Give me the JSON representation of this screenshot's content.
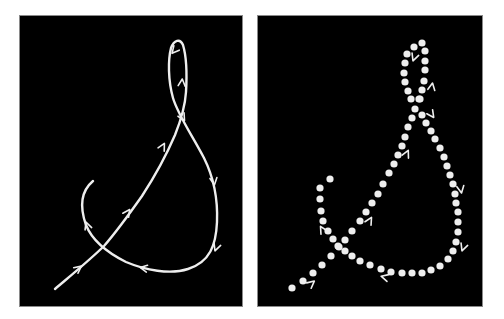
{
  "figure": {
    "colors": {
      "background": "#ffffff",
      "panel": "#000000",
      "stroke": "#eeeeee",
      "panel_border": "#8a8a8a"
    },
    "panels": [
      {
        "id": "left",
        "style": "continuous-curve",
        "path": "M55,289 C75,272 92,258 104,246 C118,230 130,213 142,196 C155,176 166,156 175,135 C181,120 185,108 186,92 C187,75 186,55 183,45 C180,38 174,40 171,48 C168,60 168,80 173,98 C178,115 192,135 204,158 C213,176 218,198 217,222 C216,245 210,262 188,269 C170,275 145,270 126,262 C108,253 92,240 86,225 C80,208 80,192 93,181",
        "arrows": [
          {
            "x": 79,
            "y": 268,
            "angle": -38
          },
          {
            "x": 128,
            "y": 212,
            "angle": -55
          },
          {
            "x": 163,
            "y": 146,
            "angle": -62
          },
          {
            "x": 182,
            "y": 82,
            "angle": -85
          },
          {
            "x": 174,
            "y": 51,
            "angle": 130
          },
          {
            "x": 183,
            "y": 118,
            "angle": 60
          },
          {
            "x": 214,
            "y": 182,
            "angle": 82
          },
          {
            "x": 216,
            "y": 248,
            "angle": 110
          },
          {
            "x": 143,
            "y": 268,
            "angle": 190
          },
          {
            "x": 87,
            "y": 225,
            "angle": -110
          }
        ]
      },
      {
        "id": "right",
        "style": "dotted-sequence",
        "dot_radius": 3.6,
        "dots": [
          [
            292,
            288
          ],
          [
            303,
            281
          ],
          [
            313,
            273
          ],
          [
            322,
            265
          ],
          [
            331,
            256
          ],
          [
            339,
            247
          ],
          [
            345,
            240
          ],
          [
            352,
            231
          ],
          [
            360,
            221
          ],
          [
            366,
            212
          ],
          [
            372,
            203
          ],
          [
            378,
            194
          ],
          [
            383,
            184
          ],
          [
            389,
            173
          ],
          [
            394,
            164
          ],
          [
            398,
            155
          ],
          [
            402,
            146
          ],
          [
            405,
            137
          ],
          [
            408,
            127
          ],
          [
            412,
            118
          ],
          [
            415,
            109
          ],
          [
            419,
            99
          ],
          [
            422,
            90
          ],
          [
            424,
            81
          ],
          [
            425,
            70
          ],
          [
            425,
            61
          ],
          [
            425,
            51
          ],
          [
            422,
            43
          ],
          [
            414,
            47
          ],
          [
            407,
            54
          ],
          [
            405,
            63
          ],
          [
            404,
            73
          ],
          [
            405,
            82
          ],
          [
            408,
            91
          ],
          [
            411,
            99
          ],
          [
            420,
            99
          ],
          [
            422,
            115
          ],
          [
            426,
            123
          ],
          [
            431,
            131
          ],
          [
            435,
            139
          ],
          [
            440,
            148
          ],
          [
            444,
            157
          ],
          [
            447,
            166
          ],
          [
            450,
            175
          ],
          [
            453,
            184
          ],
          [
            455,
            194
          ],
          [
            456,
            203
          ],
          [
            458,
            212
          ],
          [
            458,
            222
          ],
          [
            458,
            232
          ],
          [
            456,
            242
          ],
          [
            453,
            251
          ],
          [
            448,
            259
          ],
          [
            440,
            266
          ],
          [
            431,
            270
          ],
          [
            422,
            273
          ],
          [
            412,
            273
          ],
          [
            402,
            273
          ],
          [
            391,
            272
          ],
          [
            381,
            269
          ],
          [
            370,
            265
          ],
          [
            360,
            261
          ],
          [
            352,
            256
          ],
          [
            345,
            251
          ],
          [
            338,
            246
          ],
          [
            333,
            239
          ],
          [
            328,
            231
          ],
          [
            323,
            221
          ],
          [
            321,
            211
          ],
          [
            320,
            199
          ],
          [
            320,
            188
          ],
          [
            330,
            179
          ]
        ],
        "arrows": [
          {
            "x": 312,
            "y": 283,
            "angle": -40
          },
          {
            "x": 370,
            "y": 220,
            "angle": -60
          },
          {
            "x": 407,
            "y": 153,
            "angle": -65
          },
          {
            "x": 432,
            "y": 86,
            "angle": -80
          },
          {
            "x": 414,
            "y": 58,
            "angle": 110
          },
          {
            "x": 432,
            "y": 115,
            "angle": 55
          },
          {
            "x": 461,
            "y": 190,
            "angle": 80
          },
          {
            "x": 463,
            "y": 248,
            "angle": 110
          },
          {
            "x": 384,
            "y": 277,
            "angle": 195
          },
          {
            "x": 322,
            "y": 229,
            "angle": -120
          }
        ]
      }
    ]
  }
}
